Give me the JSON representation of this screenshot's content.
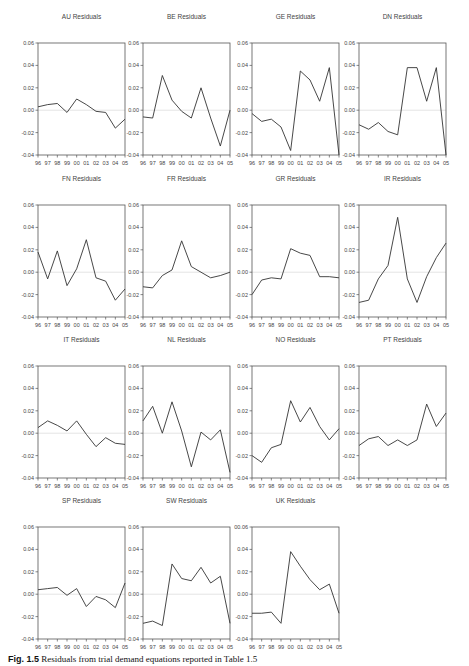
{
  "figure": {
    "caption_label": "Fig. 1.5",
    "caption_text": "Residuals from trial demand equations reported in Table 1.5"
  },
  "colors": {
    "line": "#333333",
    "axis": "#555555",
    "zero_line": "#dddddd",
    "text": "#444444"
  },
  "chart_data": [
    {
      "type": "line",
      "title": "AU Residuals",
      "x": [
        "96",
        "97",
        "98",
        "99",
        "00",
        "01",
        "02",
        "03",
        "04",
        "05"
      ],
      "values": [
        0.003,
        0.005,
        0.006,
        -0.002,
        0.01,
        0.005,
        -0.001,
        -0.002,
        -0.016,
        -0.008
      ],
      "ylim": [
        -0.04,
        0.06
      ],
      "yticks": [
        "0.06",
        "0.04",
        "0.02",
        "0.00",
        "-0.02",
        "-0.04"
      ],
      "zero_line": true
    },
    {
      "type": "line",
      "title": "BE Residuals",
      "x": [
        "96",
        "97",
        "98",
        "99",
        "00",
        "01",
        "02",
        "03",
        "04",
        "05"
      ],
      "values": [
        -0.006,
        -0.007,
        0.031,
        0.009,
        -0.001,
        -0.007,
        0.02,
        -0.007,
        -0.032,
        0.0
      ],
      "ylim": [
        -0.04,
        0.06
      ],
      "yticks": [
        "0.06",
        "0.04",
        "0.02",
        "0.00",
        "-0.02",
        "-0.04"
      ],
      "zero_line": true
    },
    {
      "type": "line",
      "title": "GE Residuals",
      "x": [
        "96",
        "97",
        "98",
        "99",
        "00",
        "01",
        "02",
        "03",
        "04",
        "05"
      ],
      "values": [
        -0.003,
        -0.01,
        -0.008,
        -0.015,
        -0.036,
        0.035,
        0.027,
        0.008,
        0.038,
        -0.04
      ],
      "ylim": [
        -0.04,
        0.06
      ],
      "yticks": [
        "0.06",
        "0.04",
        "0.02",
        "0.00",
        "-0.02",
        "-0.04"
      ],
      "zero_line": true
    },
    {
      "type": "line",
      "title": "DN Residuals",
      "x": [
        "96",
        "97",
        "98",
        "99",
        "00",
        "01",
        "02",
        "03",
        "04",
        "05"
      ],
      "values": [
        -0.013,
        -0.017,
        -0.011,
        -0.019,
        -0.022,
        0.038,
        0.038,
        0.008,
        0.038,
        -0.04
      ],
      "ylim": [
        -0.04,
        0.06
      ],
      "yticks": [
        "0.06",
        "0.04",
        "0.02",
        "0.00",
        "-0.02",
        "-0.04"
      ],
      "zero_line": true
    },
    {
      "type": "line",
      "title": "FN Residuals",
      "x": [
        "96",
        "97",
        "98",
        "99",
        "00",
        "01",
        "02",
        "03",
        "04",
        "05"
      ],
      "values": [
        0.018,
        -0.006,
        0.019,
        -0.012,
        0.003,
        0.029,
        -0.005,
        -0.008,
        -0.025,
        -0.015
      ],
      "ylim": [
        -0.04,
        0.06
      ],
      "yticks": [
        "0.06",
        "0.04",
        "0.02",
        "0.00",
        "-0.02",
        "-0.04"
      ],
      "zero_line": true
    },
    {
      "type": "line",
      "title": "FR Residuals",
      "x": [
        "96",
        "97",
        "98",
        "99",
        "00",
        "01",
        "02",
        "03",
        "04",
        "05"
      ],
      "values": [
        -0.013,
        -0.014,
        -0.003,
        0.002,
        0.028,
        0.005,
        0.0,
        -0.005,
        -0.003,
        0.0
      ],
      "ylim": [
        -0.04,
        0.06
      ],
      "yticks": [
        "0.06",
        "0.04",
        "0.02",
        "0.00",
        "-0.02",
        "-0.04"
      ],
      "zero_line": true
    },
    {
      "type": "line",
      "title": "GR Residuals",
      "x": [
        "96",
        "97",
        "98",
        "99",
        "00",
        "01",
        "02",
        "03",
        "04",
        "05"
      ],
      "values": [
        -0.02,
        -0.007,
        -0.005,
        -0.006,
        0.021,
        0.017,
        0.015,
        -0.004,
        -0.004,
        -0.005
      ],
      "ylim": [
        -0.04,
        0.06
      ],
      "yticks": [
        "0.06",
        "0.04",
        "0.02",
        "0.00",
        "-0.02",
        "-0.04"
      ],
      "zero_line": true
    },
    {
      "type": "line",
      "title": "IR Residuals",
      "x": [
        "96",
        "97",
        "98",
        "99",
        "00",
        "01",
        "02",
        "03",
        "04",
        "05"
      ],
      "values": [
        -0.027,
        -0.025,
        -0.006,
        0.006,
        0.049,
        -0.006,
        -0.027,
        -0.004,
        0.013,
        0.026
      ],
      "ylim": [
        -0.04,
        0.06
      ],
      "yticks": [
        "0.06",
        "0.04",
        "0.02",
        "0.00",
        "-0.02",
        "-0.04"
      ],
      "zero_line": true
    },
    {
      "type": "line",
      "title": "IT Residuals",
      "x": [
        "96",
        "97",
        "98",
        "99",
        "00",
        "01",
        "02",
        "03",
        "04",
        "05"
      ],
      "values": [
        0.005,
        0.011,
        0.007,
        0.002,
        0.011,
        -0.001,
        -0.012,
        -0.004,
        -0.009,
        -0.01
      ],
      "ylim": [
        -0.04,
        0.06
      ],
      "yticks": [
        "0.06",
        "0.04",
        "0.02",
        "0.00",
        "-0.02",
        "-0.04"
      ],
      "zero_line": true
    },
    {
      "type": "line",
      "title": "NL Residuals",
      "x": [
        "96",
        "97",
        "98",
        "99",
        "00",
        "01",
        "02",
        "03",
        "04",
        "05"
      ],
      "values": [
        0.011,
        0.024,
        0.0,
        0.028,
        0.002,
        -0.03,
        0.001,
        -0.006,
        0.003,
        -0.035
      ],
      "ylim": [
        -0.04,
        0.06
      ],
      "yticks": [
        "0.06",
        "0.04",
        "0.02",
        "0.00",
        "-0.02",
        "-0.04"
      ],
      "zero_line": true
    },
    {
      "type": "line",
      "title": "NO Residuals",
      "x": [
        "96",
        "97",
        "98",
        "99",
        "00",
        "01",
        "02",
        "03",
        "04",
        "05"
      ],
      "values": [
        -0.02,
        -0.026,
        -0.013,
        -0.01,
        0.029,
        0.01,
        0.023,
        0.006,
        -0.006,
        0.004
      ],
      "ylim": [
        -0.04,
        0.06
      ],
      "yticks": [
        "0.06",
        "0.04",
        "0.02",
        "0.00",
        "-0.02",
        "-0.04"
      ],
      "zero_line": true
    },
    {
      "type": "line",
      "title": "PT Residuals",
      "x": [
        "96",
        "97",
        "98",
        "99",
        "00",
        "01",
        "02",
        "03",
        "04",
        "05"
      ],
      "values": [
        -0.011,
        -0.005,
        -0.003,
        -0.011,
        -0.006,
        -0.011,
        -0.006,
        0.026,
        0.006,
        0.018
      ],
      "ylim": [
        -0.04,
        0.06
      ],
      "yticks": [
        "0.06",
        "0.04",
        "0.02",
        "0.00",
        "-0.02",
        "-0.04"
      ],
      "zero_line": true
    },
    {
      "type": "line",
      "title": "SP Residuals",
      "x": [
        "96",
        "97",
        "98",
        "99",
        "00",
        "01",
        "02",
        "03",
        "04",
        "05"
      ],
      "values": [
        0.004,
        0.005,
        0.006,
        -0.001,
        0.005,
        -0.011,
        -0.002,
        -0.005,
        -0.012,
        0.01
      ],
      "ylim": [
        -0.04,
        0.06
      ],
      "yticks": [
        "0.06",
        "0.04",
        "0.02",
        "0.00",
        "-0.02",
        "-0.04"
      ],
      "zero_line": true
    },
    {
      "type": "line",
      "title": "SW Residuals",
      "x": [
        "96",
        "97",
        "98",
        "99",
        "00",
        "01",
        "02",
        "03",
        "04",
        "05"
      ],
      "values": [
        -0.026,
        -0.024,
        -0.028,
        0.027,
        0.014,
        0.012,
        0.024,
        0.01,
        0.016,
        -0.026
      ],
      "ylim": [
        -0.04,
        0.06
      ],
      "yticks": [
        "0.06",
        "0.04",
        "0.02",
        "0.00",
        "-0.02",
        "-0.04"
      ],
      "zero_line": true
    },
    {
      "type": "line",
      "title": "UK Residuals",
      "x": [
        "96",
        "97",
        "98",
        "99",
        "00",
        "01",
        "02",
        "03",
        "04",
        "05"
      ],
      "values": [
        -0.017,
        -0.017,
        -0.016,
        -0.026,
        0.038,
        0.025,
        0.013,
        0.004,
        0.009,
        -0.017
      ],
      "ylim": [
        -0.04,
        0.06
      ],
      "yticks": [
        "00.06",
        "0.04",
        "0.02",
        "0.00",
        "-0.02",
        "-0.04"
      ],
      "zero_line": true
    }
  ]
}
